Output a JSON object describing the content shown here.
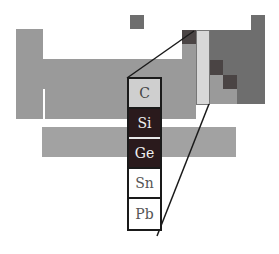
{
  "figure": {
    "highlighted_group": {
      "elements": [
        {
          "symbol": "C",
          "shade": "light"
        },
        {
          "symbol": "Si",
          "shade": "dark"
        },
        {
          "symbol": "Ge",
          "shade": "dark"
        },
        {
          "symbol": "Sn",
          "shade": "white"
        },
        {
          "symbol": "Pb",
          "shade": "white"
        }
      ]
    },
    "colors": {
      "metal_region": "#9a9a9a",
      "nonmetal_region": "#6e6e6e",
      "metalloid_cells": "#4a4444",
      "group14_strip": "#d8d8d8",
      "semiconductor_cells": "#2a1a1c",
      "outline": "#1a1a1a"
    }
  }
}
